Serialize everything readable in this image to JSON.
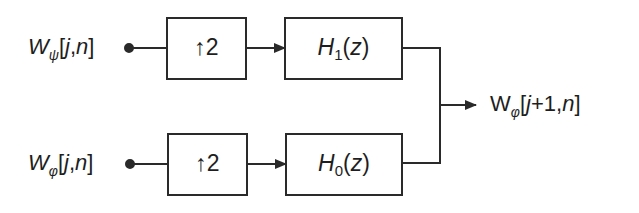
{
  "diagram": {
    "type": "synthesis-filter-bank",
    "inputs": [
      {
        "id": "top",
        "symbol": "W",
        "subscript": "ψ",
        "args": "[j,n]",
        "arg_j": "j",
        "arg_n": "n"
      },
      {
        "id": "bottom",
        "symbol": "W",
        "subscript": "φ",
        "args": "[j,n]",
        "arg_j": "j",
        "arg_n": "n"
      }
    ],
    "upsamplers": [
      {
        "id": "up-top",
        "label": "↑2"
      },
      {
        "id": "up-bottom",
        "label": "↑2"
      }
    ],
    "filters": [
      {
        "id": "filter-top",
        "name": "H",
        "index": "1",
        "arg": "(z)",
        "arg_var": "z"
      },
      {
        "id": "filter-bottom",
        "name": "H",
        "index": "0",
        "arg": "(z)",
        "arg_var": "z"
      }
    ],
    "output": {
      "symbol": "W",
      "subscript": "φ",
      "args": "[j+1,n]",
      "arg_j": "j",
      "arg_rest": "+1,",
      "arg_n": "n"
    },
    "colors": {
      "stroke": "#2a2a2a",
      "background": "#ffffff"
    }
  }
}
